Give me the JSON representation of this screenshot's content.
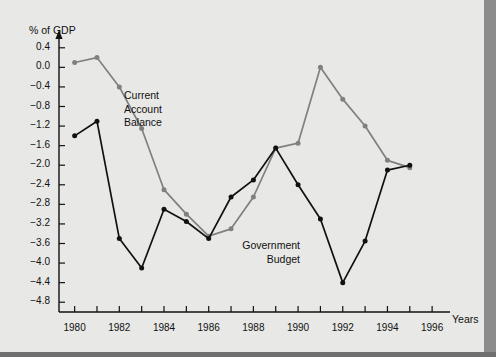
{
  "figure": {
    "background_color": "#e8e8e6",
    "border_color": "#8c8c8c"
  },
  "chart_data": {
    "type": "line",
    "title": "",
    "subtitle": "",
    "xlabel": "Years",
    "ylabel": "% of GDP",
    "grid": false,
    "legend_position": "inline-annotations",
    "x": [
      1980,
      1981,
      1982,
      1983,
      1984,
      1985,
      1986,
      1987,
      1988,
      1989,
      1990,
      1991,
      1992,
      1993,
      1994,
      1995
    ],
    "xlim": [
      1979.3,
      1996.8
    ],
    "ylim": [
      -5.0,
      0.6
    ],
    "xticks": [
      1980,
      1981,
      1982,
      1983,
      1984,
      1985,
      1986,
      1987,
      1988,
      1989,
      1990,
      1991,
      1992,
      1993,
      1994,
      1995,
      1996
    ],
    "xtick_labels": [
      "1980",
      "",
      "1982",
      "",
      "1984",
      "",
      "1986",
      "",
      "1988",
      "",
      "1990",
      "",
      "1992",
      "",
      "1994",
      "",
      "1996"
    ],
    "yticks": [
      0.4,
      0.0,
      -0.4,
      -0.8,
      -1.2,
      -1.6,
      -2.0,
      -2.4,
      -2.8,
      -3.2,
      -3.6,
      -4.0,
      -4.4,
      -4.8
    ],
    "ytick_labels": [
      "0.4",
      "0.0",
      "-0.4",
      "-0.8",
      "-1.2",
      "-1.6",
      "-2.0",
      "-2.4",
      "-2.8",
      "-3.2",
      "-3.6",
      "-4.0",
      "-4.4",
      "-4.8"
    ],
    "series": [
      {
        "name": "Current Account Balance",
        "color": "#808080",
        "marker": "circle",
        "annotation": "Current\nAccount\nBalance",
        "values": [
          0.1,
          0.2,
          -0.4,
          -1.25,
          -2.5,
          -3.0,
          -3.45,
          -3.3,
          -2.65,
          -1.65,
          -1.55,
          0.0,
          -0.65,
          -1.2,
          -1.9,
          -2.05
        ]
      },
      {
        "name": "Government Budget",
        "color": "#111111",
        "marker": "circle",
        "annotation": "Government\nBudget",
        "values": [
          -1.4,
          -1.1,
          -3.5,
          -4.1,
          -2.9,
          -3.15,
          -3.5,
          -2.65,
          -2.3,
          -1.65,
          -2.4,
          -3.1,
          -4.4,
          -3.55,
          -2.1,
          -2.0
        ]
      }
    ]
  },
  "annotations": {
    "current_account_lines": [
      "Current",
      "Account",
      "Balance"
    ],
    "government_budget_lines": [
      "Government",
      "Budget"
    ]
  }
}
